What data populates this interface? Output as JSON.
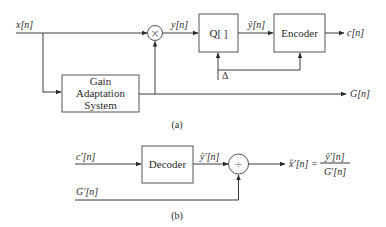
{
  "diagram_a": {
    "caption": "(a)",
    "input_label": "x[n]",
    "multiplier_symbol": "×",
    "mult_out_label": "y[n]",
    "quantizer_label": "Q[ ]",
    "quant_out_label": "ŷ[n]",
    "encoder_label": "Encoder",
    "encoder_out_label": "c[n]",
    "step_label": "Δ",
    "gain_box_lines": [
      "Gain",
      "Adaptation",
      "System"
    ],
    "gain_out_label": "G[n]"
  },
  "diagram_b": {
    "caption": "(b)",
    "input_label": "c′[n]",
    "decoder_label": "Decoder",
    "decoder_out_label": "ŷ′[n]",
    "divider_symbol": "÷",
    "gain_input_label": "G′[n]",
    "output_lhs": "x̂′[n] =",
    "output_numerator": "ŷ′[n]",
    "output_denominator": "G′[n]"
  },
  "colors": {
    "line": "#3a3a3a",
    "box_border": "#555555",
    "text": "#2a2a2a",
    "background": "#ffffff"
  }
}
